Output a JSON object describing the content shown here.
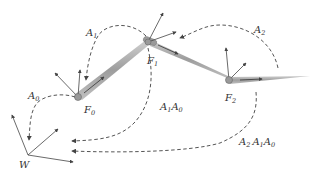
{
  "diagram": {
    "type": "coordinate-frame-transform-diagram",
    "frames": [
      {
        "id": "W",
        "label": "W",
        "sub": ""
      },
      {
        "id": "F0",
        "label": "F",
        "sub": "0"
      },
      {
        "id": "F1",
        "label": "F",
        "sub": "1"
      },
      {
        "id": "F2",
        "label": "F",
        "sub": "2"
      }
    ],
    "transforms": [
      {
        "id": "A0",
        "parts": [
          {
            "t": "A",
            "s": "0"
          }
        ],
        "from": "F0",
        "to": "W"
      },
      {
        "id": "A1",
        "parts": [
          {
            "t": "A",
            "s": "1"
          }
        ],
        "from": "F1",
        "to": "F0"
      },
      {
        "id": "A2",
        "parts": [
          {
            "t": "A",
            "s": "2"
          }
        ],
        "from": "F2",
        "to": "F1"
      },
      {
        "id": "A1A0",
        "parts": [
          {
            "t": "A",
            "s": "1"
          },
          {
            "t": "A",
            "s": "0"
          }
        ],
        "from": "F1",
        "to": "W"
      },
      {
        "id": "A2A1A0",
        "parts": [
          {
            "t": "A",
            "s": "2"
          },
          {
            "t": "A",
            "s": "1"
          },
          {
            "t": "A",
            "s": "0"
          }
        ],
        "from": "F2",
        "to": "W"
      }
    ],
    "colors": {
      "line": "#555555",
      "axis": "#444444",
      "link": "#9a9a9a",
      "text": "#333333"
    }
  }
}
